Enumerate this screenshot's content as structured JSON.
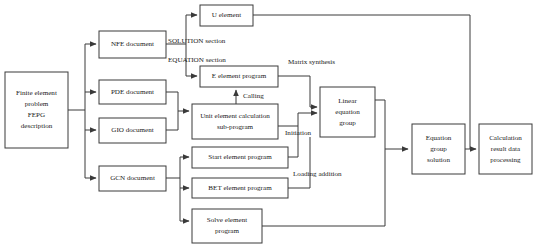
{
  "diagram": {
    "style": {
      "background": "#ffffff",
      "box_fill": "#ffffff",
      "box_stroke": "#3a3a3a",
      "text_color": "#1a1a1a"
    },
    "nodes": [
      {
        "id": "fe_problem",
        "name": "finite-element-problem-box",
        "lines": [
          "Finite element",
          "problem",
          "FEPG",
          "description"
        ],
        "x": 5,
        "y": 72,
        "w": 63,
        "h": 76
      },
      {
        "id": "nfe_doc",
        "name": "nfe-document-box",
        "lines": [
          "NFE document"
        ],
        "x": 99,
        "y": 31,
        "w": 67,
        "h": 27
      },
      {
        "id": "pde_doc",
        "name": "pde-document-box",
        "lines": [
          "PDE document"
        ],
        "x": 99,
        "y": 80,
        "w": 67,
        "h": 24
      },
      {
        "id": "gio_doc",
        "name": "gio-document-box",
        "lines": [
          "GIO document"
        ],
        "x": 99,
        "y": 118,
        "w": 67,
        "h": 25
      },
      {
        "id": "gcn_doc",
        "name": "gcn-document-box",
        "lines": [
          "GCN document"
        ],
        "x": 99,
        "y": 166,
        "w": 67,
        "h": 25
      },
      {
        "id": "u_element",
        "name": "u-element-box",
        "lines": [
          "U element"
        ],
        "x": 200,
        "y": 5,
        "w": 53,
        "h": 21
      },
      {
        "id": "e_element_program",
        "name": "e-element-program-box",
        "lines": [
          "E element program"
        ],
        "x": 200,
        "y": 66,
        "w": 78,
        "h": 21
      },
      {
        "id": "unit_element_calc",
        "name": "unit-element-calculation-sub-program-box",
        "lines": [
          "Unit element calculation",
          "sub-program"
        ],
        "x": 192,
        "y": 104,
        "w": 86,
        "h": 35
      },
      {
        "id": "start_element_program",
        "name": "start-element-program-box",
        "lines": [
          "Start element program"
        ],
        "x": 192,
        "y": 147,
        "w": 96,
        "h": 21
      },
      {
        "id": "bet_element_program",
        "name": "bet-element-program-box",
        "lines": [
          "BET element program"
        ],
        "x": 192,
        "y": 178,
        "w": 96,
        "h": 20
      },
      {
        "id": "solve_element_program",
        "name": "solve-element-program-box",
        "lines": [
          "Solve element",
          "program"
        ],
        "x": 192,
        "y": 209,
        "w": 70,
        "h": 34
      },
      {
        "id": "linear_equation_group",
        "name": "linear-equation-group-box",
        "lines": [
          "Linear",
          "equation",
          "group"
        ],
        "x": 320,
        "y": 87,
        "w": 55,
        "h": 50
      },
      {
        "id": "equation_group_solution",
        "name": "equation-group-solution-box",
        "lines": [
          "Equation",
          "group",
          "solution"
        ],
        "x": 412,
        "y": 124,
        "w": 53,
        "h": 50
      },
      {
        "id": "calculation_result",
        "name": "calculation-result-data-processing-box",
        "lines": [
          "Calculation",
          "result data",
          "processing"
        ],
        "x": 479,
        "y": 124,
        "w": 53,
        "h": 50
      }
    ],
    "edge_labels": [
      {
        "id": "solution_section",
        "name": "edge-label-solution-section",
        "text": "SOLUTION section",
        "x": 168,
        "y": 41
      },
      {
        "id": "equation_section",
        "name": "edge-label-equation-section",
        "text": "EQUATION section",
        "x": 168,
        "y": 60
      },
      {
        "id": "matrix_synthesis",
        "name": "edge-label-matrix-synthesis",
        "text": "Matrix synthesis",
        "x": 288,
        "y": 62
      },
      {
        "id": "calling",
        "name": "edge-label-calling",
        "text": "Calling",
        "x": 243,
        "y": 96
      },
      {
        "id": "initiation",
        "name": "edge-label-initiation",
        "text": "Initiation",
        "x": 285,
        "y": 133
      },
      {
        "id": "loading_addition",
        "name": "edge-label-loading-addition",
        "text": "Loading addition",
        "x": 293,
        "y": 174
      }
    ],
    "edges": [
      {
        "id": "fe-to-bus",
        "name": "edge-fe-problem-to-bus",
        "d": "M 68 110 L 85 110"
      },
      {
        "id": "bus-vertical",
        "name": "edge-document-bus",
        "d": "M 85 44 L 85 178"
      },
      {
        "id": "bus-to-nfe",
        "name": "edge-bus-to-nfe",
        "d": "M 85 44 L 96 44",
        "arrow": "end"
      },
      {
        "id": "bus-to-pde",
        "name": "edge-bus-to-pde",
        "d": "M 85 92 L 96 92",
        "arrow": "end"
      },
      {
        "id": "bus-to-gio",
        "name": "edge-bus-to-gio",
        "d": "M 85 130 L 96 130",
        "arrow": "end"
      },
      {
        "id": "bus-to-gcn",
        "name": "edge-bus-to-gcn",
        "d": "M 85 178 L 96 178",
        "arrow": "end"
      },
      {
        "id": "nfe-split",
        "name": "edge-nfe-split",
        "d": "M 166 44 L 186 44"
      },
      {
        "id": "nfe-to-u",
        "name": "edge-nfe-to-u-element",
        "d": "M 186 44 L 186 15 L 197 15",
        "arrow": "end"
      },
      {
        "id": "nfe-to-e",
        "name": "edge-nfe-to-e-element",
        "d": "M 186 44 L 186 76 L 197 76",
        "arrow": "end"
      },
      {
        "id": "pde-gio-merge",
        "name": "edge-pde-gio-merge",
        "d": "M 166 92 L 178 92 L 178 130 L 166 130"
      },
      {
        "id": "pde-gio-to-unit",
        "name": "edge-pde-gio-to-unit-element",
        "d": "M 178 111 L 189 111",
        "arrow": "end"
      },
      {
        "id": "gcn-split",
        "name": "edge-gcn-split",
        "d": "M 166 178 L 180 178"
      },
      {
        "id": "gcn-bus",
        "name": "edge-gcn-bus",
        "d": "M 180 157 L 180 221"
      },
      {
        "id": "gcn-to-start",
        "name": "edge-gcn-to-start-element",
        "d": "M 180 157 L 189 157",
        "arrow": "end"
      },
      {
        "id": "gcn-to-bet",
        "name": "edge-gcn-to-bet-element",
        "d": "M 180 188 L 189 188",
        "arrow": "end"
      },
      {
        "id": "gcn-to-solve",
        "name": "edge-gcn-to-solve-element",
        "d": "M 180 221 L 189 221",
        "arrow": "end"
      },
      {
        "id": "unit-to-e-calling",
        "name": "edge-unit-element-to-e-element-calling",
        "d": "M 236 104 L 236 90",
        "arrow": "end"
      },
      {
        "id": "e-to-linear",
        "name": "edge-e-element-to-linear-equation",
        "d": "M 278 76 L 310 76 L 310 107 L 317 107",
        "arrow": "end"
      },
      {
        "id": "unit-to-linear-init",
        "name": "edge-unit-element-to-linear-initiation",
        "d": "M 278 126 L 298 126 L 298 113 L 317 113",
        "arrow": "end"
      },
      {
        "id": "start-to-linear",
        "name": "edge-start-element-to-linear",
        "d": "M 288 157 L 298 157 L 298 126"
      },
      {
        "id": "bet-to-linear",
        "name": "edge-bet-element-to-linear-loading",
        "d": "M 288 188 L 310 188 L 310 137"
      },
      {
        "id": "solve-to-equation",
        "name": "edge-solve-element-to-equation-group",
        "d": "M 262 226 L 385 226 L 385 149 L 408 149",
        "arrow": "end"
      },
      {
        "id": "linear-to-equation",
        "name": "edge-linear-equation-to-equation-group",
        "d": "M 375 100 L 385 100 L 385 149"
      },
      {
        "id": "equation-to-calc",
        "name": "edge-equation-group-to-calculation-result",
        "d": "M 465 149 L 476 149",
        "arrow": "end"
      },
      {
        "id": "u-feedback",
        "name": "edge-u-element-feedback",
        "d": "M 253 15 L 470 15 L 470 149"
      }
    ]
  }
}
